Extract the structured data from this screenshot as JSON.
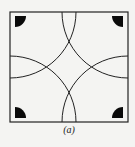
{
  "figure": {
    "caption": "(a)",
    "square": {
      "x": 10,
      "y": 12,
      "size": 118
    },
    "arc_radius": 66,
    "corner_disk_radius": 10,
    "corner_disk_inset": 4,
    "stroke_color": "#222222",
    "fill_color": "#0a0a0a",
    "background": "#f4f4f2"
  }
}
